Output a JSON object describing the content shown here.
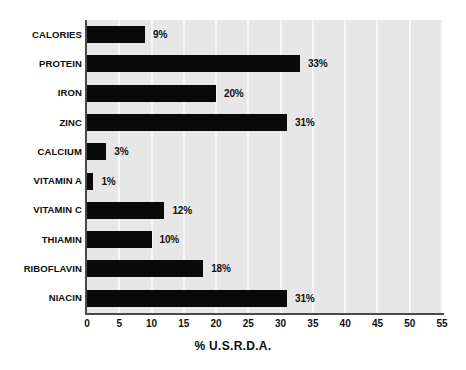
{
  "chart_data": {
    "type": "bar",
    "orientation": "horizontal",
    "title": "",
    "subtitle": "",
    "xlabel": "% U.S.R.D.A.",
    "ylabel": "",
    "xlim": [
      0,
      55
    ],
    "xticks": [
      0,
      5,
      10,
      15,
      20,
      25,
      30,
      35,
      40,
      45,
      50,
      55
    ],
    "xtick_labels": [
      "0",
      "5",
      "10",
      "15",
      "20",
      "25",
      "30",
      "35",
      "40",
      "45",
      "50",
      "55"
    ],
    "grid": true,
    "grid_axis": "x",
    "legend": false,
    "legend_position": "none",
    "categories": [
      "CALORIES",
      "PROTEIN",
      "IRON",
      "ZINC",
      "CALCIUM",
      "VITAMIN A",
      "VITAMIN C",
      "THIAMIN",
      "RIBOFLAVIN",
      "NIACIN"
    ],
    "values": [
      9,
      33,
      20,
      31,
      3,
      1,
      12,
      10,
      18,
      31
    ],
    "value_labels": [
      "9%",
      "33%",
      "20%",
      "31%",
      "3%",
      "1%",
      "12%",
      "10%",
      "18%",
      "31%"
    ],
    "bars": [
      {
        "category": "CALORIES",
        "value": 9,
        "label": "9%"
      },
      {
        "category": "PROTEIN",
        "value": 33,
        "label": "33%"
      },
      {
        "category": "IRON",
        "value": 20,
        "label": "20%"
      },
      {
        "category": "ZINC",
        "value": 31,
        "label": "31%"
      },
      {
        "category": "CALCIUM",
        "value": 3,
        "label": "3%"
      },
      {
        "category": "VITAMIN A",
        "value": 1,
        "label": "1%"
      },
      {
        "category": "VITAMIN C",
        "value": 12,
        "label": "12%"
      },
      {
        "category": "THIAMIN",
        "value": 10,
        "label": "10%"
      },
      {
        "category": "RIBOFLAVIN",
        "value": 18,
        "label": "18%"
      },
      {
        "category": "NIACIN",
        "value": 31,
        "label": "31%"
      }
    ]
  },
  "colors": {
    "bar": "#0a0a0a",
    "plot_background": "#e7e7e7",
    "gridline": "#f7f7f7",
    "axis": "#4a4a4a",
    "page_background": "#ffffff",
    "text": "#111111"
  }
}
